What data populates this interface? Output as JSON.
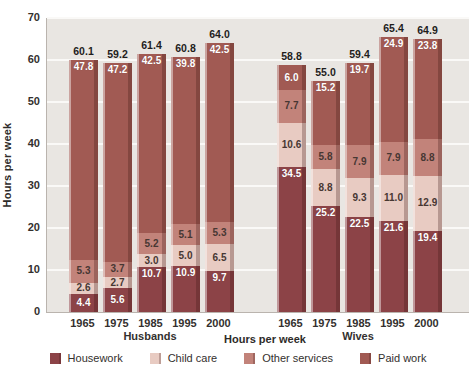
{
  "chart_data": {
    "type": "bar",
    "stacked": true,
    "title": "",
    "ylabel": "Hours per week",
    "xlabel": "Hours per week",
    "ylim": [
      0,
      70
    ],
    "yticks": [
      0,
      10,
      20,
      30,
      40,
      50,
      60,
      70
    ],
    "grid": "horizontal-white-on-gray",
    "legend_position": "bottom",
    "legend": [
      "Housework",
      "Child care",
      "Other services",
      "Paid work"
    ],
    "colors": {
      "housework": "#8c4347",
      "childcare": "#e8cbc2",
      "other": "#c2837a",
      "paid": "#a15a53",
      "plot_background": "#e9e6e2",
      "gridline": "#faf9f7"
    },
    "groups": [
      {
        "label": "Husbands",
        "bars": [
          {
            "year": "1965",
            "housework": 4.4,
            "childcare": 2.6,
            "other": 5.3,
            "paid": 47.8,
            "total": 60.1
          },
          {
            "year": "1975",
            "housework": 5.6,
            "childcare": 2.7,
            "other": 3.7,
            "paid": 47.2,
            "total": 59.2
          },
          {
            "year": "1985",
            "housework": 10.7,
            "childcare": 3.0,
            "other": 5.2,
            "paid": 42.5,
            "total": 61.4
          },
          {
            "year": "1995",
            "housework": 10.9,
            "childcare": 5.0,
            "other": 5.1,
            "paid": 39.8,
            "total": 60.8
          },
          {
            "year": "2000",
            "housework": 9.7,
            "childcare": 6.5,
            "other": 5.3,
            "paid": 42.5,
            "total": 64.0
          }
        ]
      },
      {
        "label": "Wives",
        "bars": [
          {
            "year": "1965",
            "housework": 34.5,
            "childcare": 10.6,
            "other": 7.7,
            "paid": 6.0,
            "total": 58.8
          },
          {
            "year": "1975",
            "housework": 25.2,
            "childcare": 8.8,
            "other": 5.8,
            "paid": 15.2,
            "total": 55.0
          },
          {
            "year": "1985",
            "housework": 22.5,
            "childcare": 9.3,
            "other": 7.9,
            "paid": 19.7,
            "total": 59.4
          },
          {
            "year": "1995",
            "housework": 21.6,
            "childcare": 11.0,
            "other": 7.9,
            "paid": 24.9,
            "total": 65.4
          },
          {
            "year": "2000",
            "housework": 19.4,
            "childcare": 12.9,
            "other": 8.8,
            "paid": 23.8,
            "total": 64.9
          }
        ]
      }
    ]
  }
}
